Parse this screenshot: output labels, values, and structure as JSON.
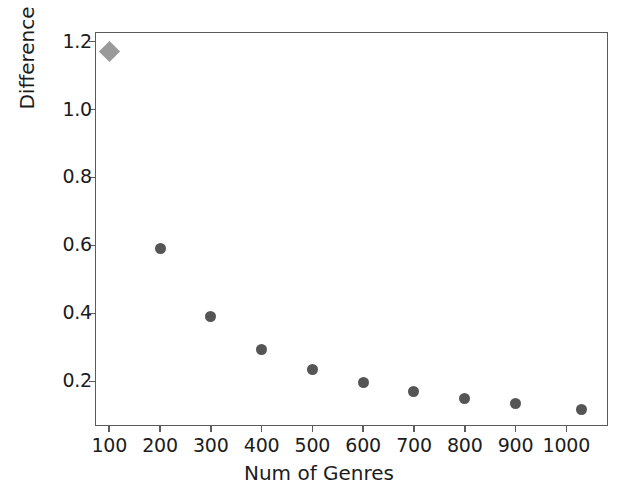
{
  "chart_data": {
    "type": "scatter",
    "title": "",
    "xlabel": "Num of Genres",
    "ylabel": "Difference",
    "xlim": [
      72,
      1082
    ],
    "ylim": [
      0.069,
      1.228
    ],
    "grid": false,
    "legend": null,
    "xticks": [
      100,
      200,
      300,
      400,
      500,
      600,
      700,
      800,
      900,
      1000
    ],
    "xticklabels": [
      "100",
      "200",
      "300",
      "400",
      "500",
      "600",
      "700",
      "800",
      "900",
      "1000"
    ],
    "yticks": [
      0.2,
      0.4,
      0.6,
      0.8,
      1.0,
      1.2
    ],
    "yticklabels": [
      "0.2",
      "0.4",
      "0.6",
      "0.8",
      "1.0",
      "1.2"
    ],
    "series": [
      {
        "name": "highlighted-point",
        "marker": "diamond",
        "color": "#9a9a9a",
        "size": 15,
        "points": [
          {
            "x": 100,
            "y": 1.17
          }
        ]
      },
      {
        "name": "difference-by-num-genres",
        "marker": "circle",
        "color": "#555555",
        "size": 11,
        "points": [
          {
            "x": 200,
            "y": 0.59
          },
          {
            "x": 300,
            "y": 0.39
          },
          {
            "x": 400,
            "y": 0.295
          },
          {
            "x": 500,
            "y": 0.235
          },
          {
            "x": 600,
            "y": 0.197
          },
          {
            "x": 700,
            "y": 0.171
          },
          {
            "x": 800,
            "y": 0.15
          },
          {
            "x": 900,
            "y": 0.135
          },
          {
            "x": 1030,
            "y": 0.118
          }
        ]
      }
    ]
  },
  "figure": {
    "background_color": "#ffffff",
    "axes_color": "#5b5b5b",
    "text_color": "#1c1c1c"
  }
}
